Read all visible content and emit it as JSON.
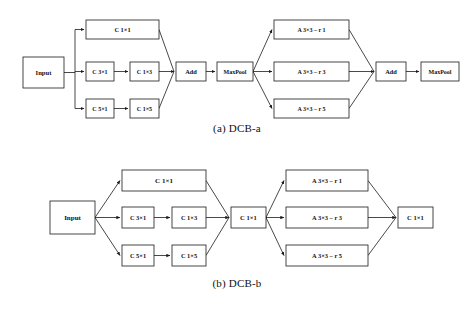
{
  "figure": {
    "background_color": "#ffffff",
    "line_color": "#1a1a1a",
    "text_color": "#111111"
  },
  "panels": [
    {
      "id": "dcb-a",
      "caption": "(a) DCB-a",
      "caption_prefix": "(a)",
      "caption_name": "DCB-a",
      "nodes": [
        {
          "id": "a-input",
          "label": "Input",
          "x": 23,
          "y": 57,
          "w": 41,
          "h": 31,
          "font": 6.6
        },
        {
          "id": "a-c11",
          "label": "C 1×1",
          "x": 86,
          "y": 20,
          "w": 73,
          "h": 19,
          "font": 6.4
        },
        {
          "id": "a-c31",
          "label": "C 3×1",
          "x": 86,
          "y": 62,
          "w": 28,
          "h": 19,
          "font": 6.0
        },
        {
          "id": "a-c13",
          "label": "C 1×3",
          "x": 130,
          "y": 62,
          "w": 29,
          "h": 19,
          "font": 6.0
        },
        {
          "id": "a-c51",
          "label": "C 5×1",
          "x": 86,
          "y": 99,
          "w": 28,
          "h": 19,
          "font": 6.0
        },
        {
          "id": "a-c15",
          "label": "C 1×5",
          "x": 130,
          "y": 99,
          "w": 29,
          "h": 19,
          "font": 6.0
        },
        {
          "id": "a-add1",
          "label": "Add",
          "x": 176,
          "y": 62,
          "w": 30,
          "h": 19,
          "font": 6.4
        },
        {
          "id": "a-pool1",
          "label": "MaxPool",
          "x": 217,
          "y": 62,
          "w": 36,
          "h": 19,
          "font": 6.0
        },
        {
          "id": "a-ar1",
          "label": "A 3×3 – r 1",
          "x": 274,
          "y": 20,
          "w": 75,
          "h": 19,
          "font": 6.0
        },
        {
          "id": "a-ar3",
          "label": "A 3×3 – r 3",
          "x": 274,
          "y": 62,
          "w": 75,
          "h": 19,
          "font": 6.0
        },
        {
          "id": "a-ar5",
          "label": "A 3×3 – r 5",
          "x": 274,
          "y": 99,
          "w": 75,
          "h": 19,
          "font": 6.0
        },
        {
          "id": "a-add2",
          "label": "Add",
          "x": 376,
          "y": 62,
          "w": 30,
          "h": 19,
          "font": 6.4
        },
        {
          "id": "a-pool2",
          "label": "MaxPool",
          "x": 421,
          "y": 62,
          "w": 38,
          "h": 19,
          "font": 6.0
        }
      ]
    },
    {
      "id": "dcb-b",
      "caption": "(b) DCB-b",
      "caption_prefix": "(b)",
      "caption_name": "DCB-b",
      "nodes": [
        {
          "id": "b-input",
          "label": "Input",
          "x": 50,
          "y": 201,
          "w": 45,
          "h": 33,
          "font": 7.0
        },
        {
          "id": "b-c11a",
          "label": "C 1×1",
          "x": 122,
          "y": 170,
          "w": 84,
          "h": 21,
          "font": 7.0
        },
        {
          "id": "b-c31",
          "label": "C 3×1",
          "x": 122,
          "y": 207,
          "w": 32,
          "h": 21,
          "font": 6.4
        },
        {
          "id": "b-c13",
          "label": "C 1×3",
          "x": 172,
          "y": 207,
          "w": 34,
          "h": 21,
          "font": 6.4
        },
        {
          "id": "b-c51",
          "label": "C 5×1",
          "x": 122,
          "y": 245,
          "w": 32,
          "h": 21,
          "font": 6.4
        },
        {
          "id": "b-c15",
          "label": "C 1×5",
          "x": 172,
          "y": 245,
          "w": 34,
          "h": 21,
          "font": 6.4
        },
        {
          "id": "b-mid11",
          "label": "C 1×1",
          "x": 231,
          "y": 207,
          "w": 35,
          "h": 21,
          "font": 6.6
        },
        {
          "id": "b-ar1",
          "label": "A 3×3 – r 1",
          "x": 286,
          "y": 170,
          "w": 82,
          "h": 21,
          "font": 6.4
        },
        {
          "id": "b-ar3",
          "label": "A 3×3 – r 3",
          "x": 286,
          "y": 207,
          "w": 82,
          "h": 21,
          "font": 6.4
        },
        {
          "id": "b-ar5",
          "label": "A 3×3 – r 5",
          "x": 286,
          "y": 245,
          "w": 82,
          "h": 21,
          "font": 6.4
        },
        {
          "id": "b-out11",
          "label": "C 1×1",
          "x": 398,
          "y": 207,
          "w": 35,
          "h": 21,
          "font": 6.6
        }
      ]
    }
  ]
}
